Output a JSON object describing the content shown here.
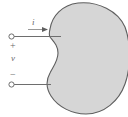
{
  "figure": {
    "colors": {
      "blob_fill": "#d6d6d6",
      "blob_stroke": "#5e5e5e",
      "wire": "#6e6e6e",
      "text": "#6a6a6a",
      "background": "#ffffff"
    },
    "labels": {
      "current": "i",
      "voltage": "v",
      "positive_terminal": "+",
      "negative_terminal": "−"
    },
    "icons": {
      "current_arrow": "arrow-right-icon",
      "top_terminal": "terminal-node-icon",
      "bottom_terminal": "terminal-node-icon",
      "network_body": "black-box-blob-icon"
    }
  }
}
